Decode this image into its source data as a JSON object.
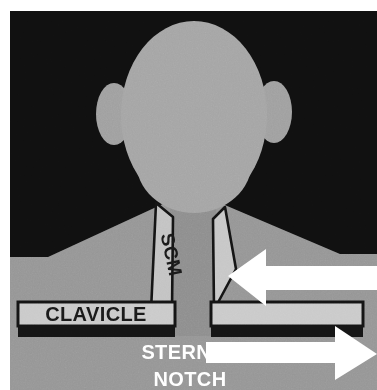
{
  "illustration": {
    "title": "Anterior neck landmark diagram",
    "subject": "head-neck-shoulders-silhouette"
  },
  "labels": {
    "scm": "SCM",
    "clavicle": "CLAVICLE",
    "sternal_notch_line1": "STERNAL",
    "sternal_notch_line2": "NOTCH"
  },
  "pointers": {
    "left_arrow_name": "arrow-pointing-left-to-scm",
    "right_arrow_name": "arrow-pointing-right-from-sternal-notch"
  },
  "colors": {
    "background": "#0d0d0d",
    "skin": "#969696",
    "head": "#a5a5a5",
    "neck": "#8e8e8e",
    "scm_band": "#c3c3c3",
    "clavicle_bar": "#c9c9c9",
    "outline": "#111111",
    "arrow": "#ffffff",
    "label_dark": "#1a1a1a",
    "label_light": "#ffffff",
    "page": "#ffffff"
  }
}
